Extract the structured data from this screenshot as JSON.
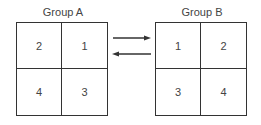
{
  "groups": [
    {
      "title": "Group A",
      "cells": [
        "2",
        "1",
        "4",
        "3"
      ]
    },
    {
      "title": "Group B",
      "cells": [
        "1",
        "2",
        "3",
        "4"
      ]
    }
  ],
  "arrows": [
    {
      "direction": "right",
      "from": "Group A",
      "to": "Group B"
    },
    {
      "direction": "left",
      "from": "Group B",
      "to": "Group A"
    }
  ]
}
